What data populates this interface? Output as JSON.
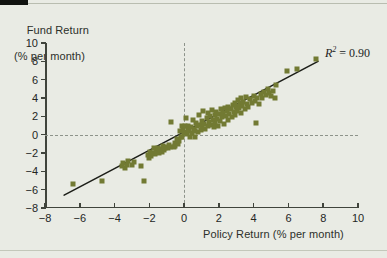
{
  "figure": {
    "y_axis_title_line1": "Fund Return",
    "y_axis_title_line2": "(% per month)",
    "x_axis_title": "Policy Return (% per month)",
    "annotation_prefix": "R",
    "annotation_exponent": "2",
    "annotation_value": " = 0.90",
    "marker_color": "#727a33",
    "fit_line_color": "#1c1e18",
    "axis_color": "#40443c",
    "reference_line_color": "#8d938a",
    "background_color": "#e9ebe4"
  },
  "chart_data": {
    "type": "scatter",
    "title": "",
    "subtitle": "",
    "xlabel": "Policy Return (% per month)",
    "ylabel": "Fund Return (% per month)",
    "xlim": [
      -8,
      10
    ],
    "ylim": [
      -8,
      10
    ],
    "xticks": [
      -8,
      -6,
      -4,
      -2,
      0,
      2,
      4,
      6,
      8,
      10
    ],
    "yticks": [
      -8,
      -6,
      -4,
      -2,
      0,
      2,
      4,
      6,
      8,
      10
    ],
    "xticklabels": [
      "−8",
      "−6",
      "−4",
      "−2",
      "0",
      "2",
      "4",
      "6",
      "8",
      "10"
    ],
    "yticklabels": [
      "−8",
      "−6",
      "−4",
      "−2",
      "0",
      "2",
      "4",
      "6",
      "8",
      "10"
    ],
    "grid": false,
    "legend": null,
    "annotations": [
      {
        "text": "R2 = 0.90",
        "x": 7.6,
        "y": 9.2,
        "statistic": "R-squared",
        "value": 0.9
      }
    ],
    "reference_lines": [
      {
        "orientation": "horizontal",
        "value": 0,
        "style": "dashed"
      },
      {
        "orientation": "vertical",
        "value": 0,
        "style": "dashed"
      }
    ],
    "fit_line": {
      "type": "linear",
      "x_start": -6.9,
      "y_start": -6.6,
      "x_end": 7.7,
      "y_end": 8.0,
      "slope": 1.0,
      "intercept": 0.3
    },
    "series": [
      {
        "name": "Fund vs Policy monthly returns",
        "marker": "square",
        "color": "#727a33",
        "points": [
          [
            -6.4,
            -5.4
          ],
          [
            -4.7,
            -5.1
          ],
          [
            -3.6,
            -3.4
          ],
          [
            -3.5,
            -3.1
          ],
          [
            -3.4,
            -3.6
          ],
          [
            -3.3,
            -3.3
          ],
          [
            -3.2,
            -2.9
          ],
          [
            -3.0,
            -3.3
          ],
          [
            -2.9,
            -3.0
          ],
          [
            -2.5,
            -3.4
          ],
          [
            -2.3,
            -5.0
          ],
          [
            -2.1,
            -2.2
          ],
          [
            -2.0,
            -2.5
          ],
          [
            -1.95,
            -1.9
          ],
          [
            -1.9,
            -2.3
          ],
          [
            -1.8,
            -2.0
          ],
          [
            -1.75,
            -1.5
          ],
          [
            -1.7,
            -2.1
          ],
          [
            -1.6,
            -1.8
          ],
          [
            -1.5,
            -1.4
          ],
          [
            -1.45,
            -2.0
          ],
          [
            -1.4,
            -1.6
          ],
          [
            -1.3,
            -1.9
          ],
          [
            -1.2,
            -1.2
          ],
          [
            -1.15,
            -1.7
          ],
          [
            -1.1,
            -1.5
          ],
          [
            -1.0,
            -1.35
          ],
          [
            -0.9,
            -1.5
          ],
          [
            -0.85,
            -1.1
          ],
          [
            -0.8,
            -1.3
          ],
          [
            -0.75,
            1.4
          ],
          [
            -0.6,
            -1.3
          ],
          [
            -0.55,
            -0.9
          ],
          [
            -0.5,
            -1.2
          ],
          [
            -0.4,
            -0.5
          ],
          [
            -0.35,
            -1.0
          ],
          [
            -0.3,
            -0.7
          ],
          [
            -0.25,
            0.4
          ],
          [
            -0.2,
            -0.3
          ],
          [
            -0.15,
            0.9
          ],
          [
            -0.1,
            -0.2
          ],
          [
            -0.05,
            0.6
          ],
          [
            0.0,
            0.2
          ],
          [
            0.05,
            0.9
          ],
          [
            0.1,
            1.8
          ],
          [
            0.15,
            0.1
          ],
          [
            0.2,
            0.5
          ],
          [
            0.25,
            1.0
          ],
          [
            0.3,
            0.35
          ],
          [
            0.35,
            -0.2
          ],
          [
            0.4,
            0.8
          ],
          [
            0.45,
            0.15
          ],
          [
            0.5,
            1.6
          ],
          [
            0.55,
            0.6
          ],
          [
            0.6,
            -0.3
          ],
          [
            0.65,
            0.45
          ],
          [
            0.7,
            1.3
          ],
          [
            0.75,
            0.9
          ],
          [
            0.8,
            0.25
          ],
          [
            0.85,
            2.2
          ],
          [
            0.9,
            1.1
          ],
          [
            0.95,
            0.5
          ],
          [
            1.0,
            1.5
          ],
          [
            1.05,
            0.7
          ],
          [
            1.1,
            2.6
          ],
          [
            1.15,
            1.2
          ],
          [
            1.2,
            0.6
          ],
          [
            1.3,
            1.8
          ],
          [
            1.35,
            0.9
          ],
          [
            1.4,
            2.4
          ],
          [
            1.45,
            1.4
          ],
          [
            1.5,
            2.0
          ],
          [
            1.55,
            1.1
          ],
          [
            1.6,
            2.7
          ],
          [
            1.65,
            1.6
          ],
          [
            1.7,
            0.8
          ],
          [
            1.75,
            2.2
          ],
          [
            1.8,
            1.3
          ],
          [
            1.85,
            2.5
          ],
          [
            1.9,
            1.75
          ],
          [
            1.95,
            0.95
          ],
          [
            2.0,
            2.3
          ],
          [
            2.05,
            1.5
          ],
          [
            2.1,
            2.8
          ],
          [
            2.2,
            1.9
          ],
          [
            2.25,
            2.4
          ],
          [
            2.3,
            1.2
          ],
          [
            2.35,
            2.9
          ],
          [
            2.4,
            2.0
          ],
          [
            2.45,
            2.6
          ],
          [
            2.5,
            1.6
          ],
          [
            2.55,
            3.0
          ],
          [
            2.6,
            2.3
          ],
          [
            2.7,
            2.8
          ],
          [
            2.75,
            1.9
          ],
          [
            2.8,
            3.2
          ],
          [
            2.85,
            2.5
          ],
          [
            2.9,
            3.5
          ],
          [
            2.95,
            2.2
          ],
          [
            3.0,
            3.0
          ],
          [
            3.05,
            2.6
          ],
          [
            3.1,
            3.8
          ],
          [
            3.15,
            2.9
          ],
          [
            3.2,
            3.4
          ],
          [
            3.25,
            2.4
          ],
          [
            3.3,
            4.0
          ],
          [
            3.35,
            3.1
          ],
          [
            3.4,
            3.6
          ],
          [
            3.5,
            2.8
          ],
          [
            3.55,
            4.1
          ],
          [
            3.6,
            3.3
          ],
          [
            3.7,
            3.0
          ],
          [
            3.8,
            3.9
          ],
          [
            3.9,
            3.5
          ],
          [
            4.0,
            4.2
          ],
          [
            4.1,
            3.7
          ],
          [
            4.2,
            4.0
          ],
          [
            4.3,
            3.4
          ],
          [
            4.4,
            4.4
          ],
          [
            4.5,
            4.0
          ],
          [
            4.6,
            4.7
          ],
          [
            4.7,
            4.3
          ],
          [
            4.8,
            5.0
          ],
          [
            4.9,
            4.5
          ],
          [
            5.0,
            4.2
          ],
          [
            5.1,
            4.8
          ],
          [
            5.2,
            4.0
          ],
          [
            5.3,
            5.4
          ],
          [
            4.15,
            1.3
          ],
          [
            5.9,
            7.0
          ],
          [
            6.5,
            7.2
          ],
          [
            7.6,
            8.3
          ]
        ]
      }
    ]
  }
}
